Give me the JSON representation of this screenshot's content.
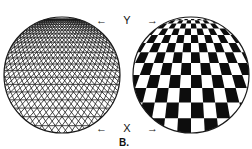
{
  "figure": {
    "caption": "B.",
    "top_axis": {
      "left_arrow": "←",
      "label": "Y",
      "right_arrow": "→"
    },
    "bottom_axis": {
      "left_arrow": "←",
      "label": "X",
      "right_arrow": "→"
    },
    "left_panel": {
      "description": "Spherical perspective triangular wireframe grid",
      "stroke_color": "#1a1a1a"
    },
    "right_panel": {
      "description": "Spherical perspective black-and-white checkerboard",
      "dark_color": "#0d0d0d",
      "light_color": "#ffffff"
    }
  }
}
